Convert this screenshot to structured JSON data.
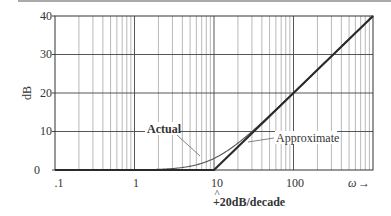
{
  "chart_data": {
    "type": "line",
    "title": "",
    "xlabel": "ω",
    "ylabel": "dB",
    "xscale": "log",
    "xlim": [
      0.1,
      1000
    ],
    "ylim": [
      0,
      40
    ],
    "x_ticks": [
      0.1,
      1,
      10,
      100
    ],
    "x_tick_labels": [
      ".1",
      "1",
      "10",
      "100"
    ],
    "y_ticks": [
      0,
      10,
      20,
      30,
      40
    ],
    "y_tick_labels": [
      "0",
      "10",
      "20",
      "30",
      "40"
    ],
    "grid": true,
    "series": [
      {
        "name": "Actual",
        "style": "thin curve",
        "formula": "10*log10(1+(w/10)^2)",
        "points": [
          [
            0.1,
            0
          ],
          [
            1,
            0.04
          ],
          [
            2,
            0.17
          ],
          [
            3,
            0.37
          ],
          [
            5,
            0.97
          ],
          [
            7,
            1.73
          ],
          [
            10,
            3.01
          ],
          [
            15,
            5.12
          ],
          [
            20,
            6.99
          ],
          [
            30,
            10.0
          ],
          [
            50,
            14.15
          ],
          [
            70,
            16.99
          ],
          [
            100,
            20.04
          ],
          [
            200,
            26.03
          ],
          [
            500,
            33.98
          ],
          [
            1000,
            40.0
          ]
        ]
      },
      {
        "name": "Approximate",
        "style": "thick straight-line asymptote",
        "points": [
          [
            0.1,
            0
          ],
          [
            10,
            0
          ],
          [
            100,
            20
          ],
          [
            1000,
            40
          ]
        ]
      }
    ],
    "annotations": [
      {
        "text": "Actual",
        "bold": true
      },
      {
        "text": "Approximate",
        "bold": false
      },
      {
        "text": "^",
        "at_x": 10
      },
      {
        "text": "+20dB/decade",
        "bold": true,
        "at_x": 10
      }
    ]
  },
  "labels": {
    "y_axis": "dB",
    "x_axis": "ω",
    "x_arrow": "→",
    "actual": "Actual",
    "approximate": "Approximate",
    "caret": "^",
    "slope": "+20dB/decade",
    "x_ticks": [
      ".1",
      "1",
      "10",
      "100"
    ],
    "y_ticks": [
      "0",
      "10",
      "20",
      "30",
      "40"
    ]
  },
  "colors": {
    "grid_minor": "#8a8a8a",
    "grid_major": "#444444",
    "approx_line": "#2a2a2a",
    "actual_curve": "#555555",
    "text": "#333333"
  }
}
